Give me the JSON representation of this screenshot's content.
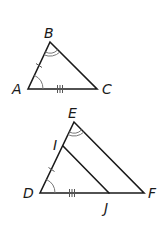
{
  "diagram": {
    "type": "geometry",
    "triangle_abc": {
      "vertices": {
        "A": {
          "label": "A",
          "x": 28,
          "y": 89
        },
        "B": {
          "label": "B",
          "x": 50,
          "y": 42
        },
        "C": {
          "label": "C",
          "x": 97,
          "y": 89
        }
      },
      "marks": {
        "AB": "single tick",
        "AC": "triple tick",
        "angle_A": "single arc",
        "angle_B": "double arc"
      }
    },
    "triangle_def": {
      "vertices": {
        "D": {
          "label": "D",
          "x": 40,
          "y": 193
        },
        "E": {
          "label": "E",
          "x": 74,
          "y": 122
        },
        "F": {
          "label": "F",
          "x": 144,
          "y": 193
        },
        "I": {
          "label": "I",
          "x": 63,
          "y": 146
        },
        "J": {
          "label": "J",
          "x": 109,
          "y": 193
        }
      },
      "marks": {
        "DI": "single tick",
        "DJ": "triple tick",
        "angle_D": "single arc",
        "angle_E": "double arc"
      }
    }
  },
  "labels": {
    "A": "A",
    "B": "B",
    "C": "C",
    "D": "D",
    "E": "E",
    "F": "F",
    "I": "I",
    "J": "J"
  },
  "colors": {
    "line": "#1a1a1a",
    "marks": "#555555"
  }
}
